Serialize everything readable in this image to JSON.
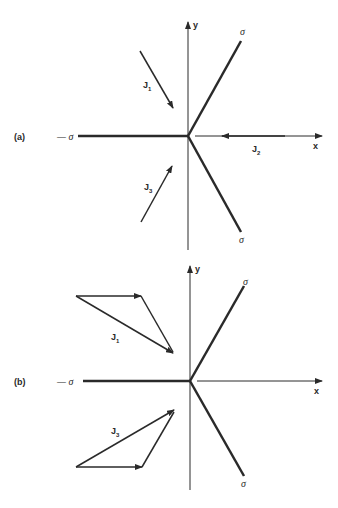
{
  "panels": [
    {
      "label": "(a)",
      "axes": {
        "x": "x",
        "y": "y"
      },
      "sigma": {
        "left": "— σ",
        "upper": "σ",
        "lower": "σ"
      },
      "vectors": [
        {
          "name": "J",
          "sub": "1"
        },
        {
          "name": "J",
          "sub": "2"
        },
        {
          "name": "J",
          "sub": "3"
        }
      ]
    },
    {
      "label": "(b)",
      "axes": {
        "x": "x",
        "y": "y"
      },
      "sigma": {
        "left": "— σ",
        "upper": "σ",
        "lower": "σ"
      },
      "vectors": [
        {
          "name": "J",
          "sub": "1"
        },
        {
          "name": "J",
          "sub": "3"
        }
      ]
    }
  ],
  "colors": {
    "ink": "#2a2a2a",
    "background": "#ffffff"
  }
}
